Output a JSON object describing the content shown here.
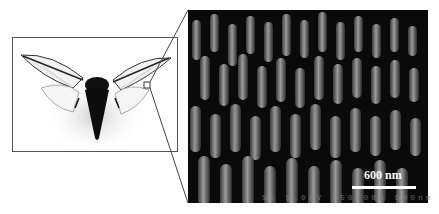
{
  "figure": {
    "left_panel": {
      "subject": "cicada",
      "description": "Photograph of a cicada with transparent wings spread",
      "inset_marker": "small square on right wing"
    },
    "right_panel": {
      "description": "SEM micrograph of nanopillar array on cicada wing surface",
      "scale_bar": {
        "label": "600 nm",
        "color": "#ffffff"
      },
      "instrument_footer": "SE  5.0kV  x50,000  600nm"
    },
    "colors": {
      "frame": "#555555",
      "sem_background": "#0a0a0a",
      "pillar": "#8a8a8a"
    }
  }
}
